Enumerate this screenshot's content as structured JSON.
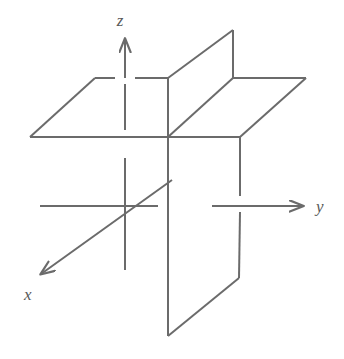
{
  "figure": {
    "width": 344,
    "height": 359,
    "background_color": "#ffffff",
    "stroke_color": "#6b6b6b",
    "stroke_width": 2,
    "labels": {
      "x": "x",
      "y": "y",
      "z": "z"
    },
    "label_positions": {
      "x": {
        "x": 24,
        "y": 300
      },
      "y": {
        "x": 316,
        "y": 212
      },
      "z": {
        "x": 120,
        "y": 26
      }
    },
    "origin": {
      "x": 168,
      "y": 137
    },
    "geometry": {
      "horizontal_plane": {
        "name": "xy-plane",
        "points": "30,137 95,78 306,78 240,137",
        "description": "parallelogram representing the horizontal xy coordinate plane"
      },
      "vertical_plane_upper": {
        "name": "yz-plane-upper",
        "points": "168,137 168,78 233,30 233,78",
        "description": "upper portion of the vertical yz coordinate plane"
      },
      "vertical_plane_lower": {
        "name": "yz-plane-lower",
        "points": "168,137 240,137 240,278 168,336",
        "description": "lower portion of the vertical yz coordinate plane"
      },
      "z_axis": {
        "name": "z-axis",
        "x": 125,
        "top": 38,
        "bottom": 270,
        "arrow_tip": {
          "x": 125,
          "y": 38
        },
        "segments": [
          {
            "y1": 38,
            "y2": 78
          },
          {
            "y1": 78,
            "y2": 137
          },
          {
            "y1": 158,
            "y2": 270
          }
        ]
      },
      "y_axis": {
        "name": "y-axis",
        "y": 206,
        "left": 40,
        "right": 308,
        "arrow_tip": {
          "x": 308,
          "y": 206
        },
        "segments": [
          {
            "x1": 40,
            "x2": 158
          },
          {
            "x1": 178,
            "x2": 196
          },
          {
            "x1": 212,
            "x2": 308
          }
        ]
      },
      "x_axis": {
        "name": "x-axis",
        "from": {
          "x": 172,
          "y": 180
        },
        "to": {
          "x": 36,
          "y": 278
        },
        "arrow_tip": {
          "x": 36,
          "y": 278
        }
      }
    }
  }
}
